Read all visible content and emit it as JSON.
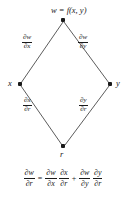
{
  "figure": {
    "type": "chain-rule-tree-diagram",
    "nodes": [
      {
        "id": "w",
        "label": "w = f(x, y)",
        "label_plain": "w",
        "x": 63,
        "y": 20,
        "label_position": "above"
      },
      {
        "id": "x",
        "label": "x",
        "x": 20,
        "y": 84,
        "label_position": "left"
      },
      {
        "id": "y",
        "label": "y",
        "x": 110,
        "y": 84,
        "label_position": "right"
      },
      {
        "id": "r",
        "label": "r",
        "x": 63,
        "y": 146,
        "label_position": "below"
      }
    ],
    "edges": [
      {
        "from": "w",
        "to": "x",
        "numerator": "∂w",
        "denominator": "∂x",
        "label_x": 30,
        "label_y": 43
      },
      {
        "from": "w",
        "to": "y",
        "numerator": "∂w",
        "denominator": "∂y",
        "label_x": 86,
        "label_y": 43
      },
      {
        "from": "x",
        "to": "r",
        "numerator": "∂x",
        "denominator": "∂r",
        "label_x": 30,
        "label_y": 106
      },
      {
        "from": "y",
        "to": "r",
        "numerator": "∂y",
        "denominator": "∂r",
        "label_x": 86,
        "label_y": 106
      }
    ],
    "equation": {
      "lhs": {
        "numerator": "∂w",
        "denominator": "∂r"
      },
      "equals": "=",
      "term1": [
        {
          "numerator": "∂w",
          "denominator": "∂x"
        },
        {
          "numerator": "∂x",
          "denominator": "∂r"
        }
      ],
      "plus": "+",
      "term2": [
        {
          "numerator": "∂w",
          "denominator": "∂y"
        },
        {
          "numerator": "∂y",
          "denominator": "∂r"
        }
      ],
      "plain_text": "∂w/∂r = ∂w/∂x · ∂x/∂r + ∂w/∂y · ∂y/∂r"
    },
    "colors": {
      "ink": "#1a1a1a",
      "line": "#4a4a4a",
      "background": "#ffffff"
    }
  }
}
